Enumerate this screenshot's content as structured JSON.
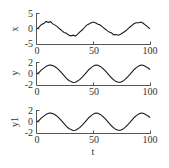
{
  "chart_data": [
    {
      "type": "line",
      "title": "",
      "xlabel": "",
      "ylabel": "x",
      "xlim": [
        0,
        100
      ],
      "ylim": [
        -5,
        5
      ],
      "xticks": [
        "0",
        "50",
        "100"
      ],
      "yticks": [
        "5",
        "0",
        "-5"
      ],
      "grid": false,
      "series": [
        {
          "name": "x",
          "x": [
            0,
            2,
            4,
            6,
            8,
            10,
            12,
            14,
            16,
            18,
            20,
            22,
            24,
            26,
            28,
            30,
            32,
            34,
            36,
            38,
            40,
            42,
            44,
            46,
            48,
            50,
            52,
            54,
            56,
            58,
            60,
            62,
            64,
            66,
            68,
            70,
            72,
            74,
            76,
            78,
            80,
            82,
            84,
            86,
            88,
            90,
            92,
            94,
            96,
            98,
            100
          ],
          "values": [
            0.0,
            0.6,
            1.4,
            1.7,
            2.4,
            2.1,
            2.3,
            1.6,
            1.2,
            0.7,
            0.0,
            -0.6,
            -1.2,
            -1.5,
            -2.0,
            -2.3,
            -2.1,
            -2.4,
            -1.8,
            -1.0,
            -0.4,
            0.4,
            1.2,
            1.6,
            2.0,
            2.2,
            1.9,
            1.5,
            1.2,
            0.6,
            0.0,
            -0.6,
            -1.1,
            -1.4,
            -2.0,
            -1.9,
            -2.1,
            -1.8,
            -1.3,
            -0.8,
            -0.2,
            0.5,
            1.1,
            1.7,
            2.0,
            2.0,
            2.2,
            1.8,
            1.2,
            0.6,
            0.0
          ]
        }
      ]
    },
    {
      "type": "line",
      "title": "",
      "xlabel": "",
      "ylabel": "y",
      "xlim": [
        0,
        100
      ],
      "ylim": [
        -2,
        2
      ],
      "xticks": [
        "0",
        "50",
        "100"
      ],
      "yticks": [
        "2",
        "0",
        "-2"
      ],
      "grid": false,
      "series": [
        {
          "name": "y",
          "x": [
            0,
            2,
            4,
            6,
            8,
            10,
            12,
            14,
            16,
            18,
            20,
            22,
            24,
            26,
            28,
            30,
            32,
            34,
            36,
            38,
            40,
            42,
            44,
            46,
            48,
            50,
            52,
            54,
            56,
            58,
            60,
            62,
            64,
            66,
            68,
            70,
            72,
            74,
            76,
            78,
            80,
            82,
            84,
            86,
            88,
            90,
            92,
            94,
            96,
            98,
            100
          ],
          "values": [
            0.0,
            0.3,
            0.7,
            1.0,
            1.3,
            1.5,
            1.55,
            1.45,
            1.25,
            0.95,
            0.55,
            0.1,
            -0.35,
            -0.8,
            -1.15,
            -1.4,
            -1.55,
            -1.5,
            -1.3,
            -1.0,
            -0.6,
            -0.15,
            0.3,
            0.75,
            1.1,
            1.4,
            1.55,
            1.5,
            1.3,
            1.0,
            0.6,
            0.15,
            -0.3,
            -0.75,
            -1.1,
            -1.4,
            -1.5,
            -1.5,
            -1.3,
            -1.0,
            -0.6,
            -0.15,
            0.3,
            0.75,
            1.1,
            1.4,
            1.55,
            1.5,
            1.3,
            1.05,
            0.75
          ]
        }
      ]
    },
    {
      "type": "line",
      "title": "",
      "xlabel": "t",
      "ylabel": "y1",
      "xlim": [
        0,
        100
      ],
      "ylim": [
        -2,
        2
      ],
      "xticks": [
        "0",
        "50",
        "100"
      ],
      "yticks": [
        "2",
        "0",
        "-2"
      ],
      "grid": false,
      "series": [
        {
          "name": "y1",
          "x": [
            0,
            2,
            4,
            6,
            8,
            10,
            12,
            14,
            16,
            18,
            20,
            22,
            24,
            26,
            28,
            30,
            32,
            34,
            36,
            38,
            40,
            42,
            44,
            46,
            48,
            50,
            52,
            54,
            56,
            58,
            60,
            62,
            64,
            66,
            68,
            70,
            72,
            74,
            76,
            78,
            80,
            82,
            84,
            86,
            88,
            90,
            92,
            94,
            96,
            98,
            100
          ],
          "values": [
            0.0,
            0.3,
            0.7,
            1.0,
            1.3,
            1.5,
            1.55,
            1.45,
            1.25,
            0.95,
            0.55,
            0.1,
            -0.35,
            -0.8,
            -1.15,
            -1.4,
            -1.55,
            -1.5,
            -1.3,
            -1.0,
            -0.6,
            -0.15,
            0.3,
            0.75,
            1.1,
            1.4,
            1.55,
            1.5,
            1.3,
            1.0,
            0.6,
            0.15,
            -0.3,
            -0.75,
            -1.1,
            -1.4,
            -1.5,
            -1.5,
            -1.3,
            -1.0,
            -0.6,
            -0.15,
            0.3,
            0.75,
            1.1,
            1.4,
            1.55,
            1.5,
            1.3,
            1.05,
            0.75
          ]
        }
      ]
    }
  ],
  "panels": [
    {
      "ylabel": "x",
      "ytick_top": "5",
      "ytick_mid": "0",
      "ytick_bot": "-5",
      "xtick_0": "0",
      "xtick_50": "50",
      "xtick_100": "100"
    },
    {
      "ylabel": "y",
      "ytick_top": "2",
      "ytick_mid": "0",
      "ytick_bot": "-2",
      "xtick_0": "0",
      "xtick_50": "50",
      "xtick_100": "100"
    },
    {
      "ylabel": "y1",
      "ytick_top": "2",
      "ytick_mid": "0",
      "ytick_bot": "-2",
      "xtick_0": "0",
      "xtick_50": "50",
      "xtick_100": "100"
    }
  ],
  "xlabel": "t",
  "colors": {
    "line": "#1a1a1a",
    "axis": "#555555",
    "text": "#333333"
  }
}
